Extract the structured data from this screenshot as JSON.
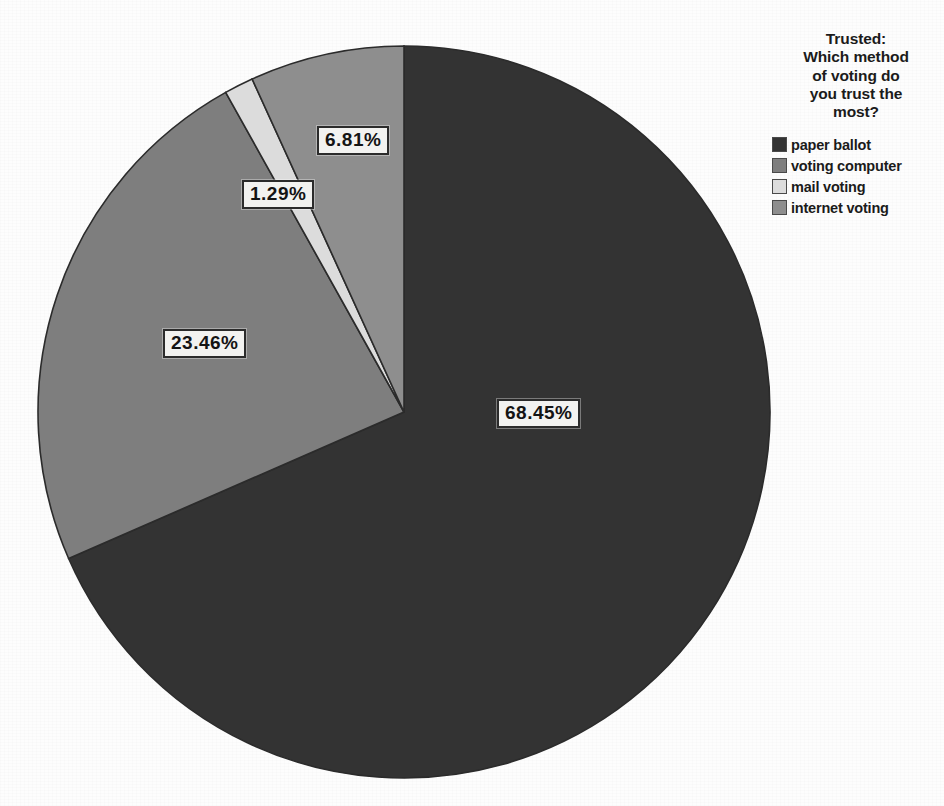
{
  "chart_data": {
    "type": "pie",
    "title": "Trusted:\nWhich method\nof voting do\nyou trust the\nmost?",
    "categories": [
      "paper ballot",
      "voting computer",
      "mail voting",
      "internet voting"
    ],
    "values": [
      68.45,
      23.46,
      1.29,
      6.81
    ],
    "value_labels": [
      "68.45%",
      "23.46%",
      "1.29%",
      "6.81%"
    ],
    "colors": [
      "#333333",
      "#7e7e7e",
      "#dcdcdc",
      "#8e8e8e"
    ],
    "legend_position": "right",
    "start_angle_deg": 0,
    "direction": "clockwise",
    "grid": false,
    "xlabel": "",
    "ylabel": ""
  },
  "legend": {
    "title": "Trusted:\nWhich method\nof voting do\nyou trust the\nmost?",
    "items": [
      {
        "label": "paper ballot",
        "color": "#333333"
      },
      {
        "label": "voting computer",
        "color": "#7e7e7e"
      },
      {
        "label": "mail voting",
        "color": "#dcdcdc"
      },
      {
        "label": "internet voting",
        "color": "#8e8e8e"
      }
    ]
  },
  "slices": [
    {
      "name": "paper ballot",
      "percent_label": "68.45%"
    },
    {
      "name": "voting computer",
      "percent_label": "23.46%"
    },
    {
      "name": "mail voting",
      "percent_label": "1.29%"
    },
    {
      "name": "internet voting",
      "percent_label": "6.81%"
    }
  ],
  "colors": {
    "background": "#fdfdfd",
    "outline": "#2b2b2b",
    "label_box_fill": "#f2f2f0",
    "text": "#1b1b1b"
  }
}
